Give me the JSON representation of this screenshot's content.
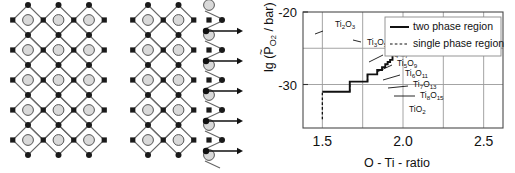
{
  "figure": {
    "left_panel": {
      "name": "crystallographic-shear-lattice-diagram",
      "description": "Two polyhedral lattice schematics: ideal rutile-type lattice (left) and sheared lattice with shear plane (right), with five arrows at right indicating shear direction",
      "arrow_count": 5,
      "atom_legend": {
        "large_circle": "metal-cation-site",
        "small_square": "oxygen-corner-site",
        "small_dot": "oxygen-vertex-site"
      },
      "colors": {
        "circle_fill": "#d9d9d9",
        "circle_stroke": "#555555",
        "node_fill": "#1a1a1a",
        "bond_stroke": "#666666",
        "arrow": "#111111"
      }
    },
    "chart_panel": {
      "legend": {
        "items": [
          {
            "label": "two phase region",
            "style": "solid"
          },
          {
            "label": "single phase region",
            "style": "dashed"
          }
        ]
      },
      "axes": {
        "xlabel": "O - Ti - ratio",
        "ylabel_main": "lg (",
        "ylabel_p": "P",
        "ylabel_tilde": "~",
        "ylabel_sub": "O",
        "ylabel_sub2": "2",
        "ylabel_tail": " / bar)",
        "xticks": [
          "1.5",
          "2.0",
          "2.5"
        ],
        "yticks": [
          "-30",
          "-20"
        ]
      },
      "annotations": [
        {
          "id": "ti2o3",
          "base": "Ti",
          "s1": "2",
          "mid": "O",
          "s2": "3"
        },
        {
          "id": "ti3o5",
          "base": "Ti",
          "s1": "3",
          "mid": "O",
          "s2": "5"
        },
        {
          "id": "ti4o7",
          "base": "Ti",
          "s1": "4",
          "mid": "O",
          "s2": "7"
        },
        {
          "id": "ti5o9",
          "base": "Ti",
          "s1": "5",
          "mid": "O",
          "s2": "9"
        },
        {
          "id": "ti6o11",
          "base": "Ti",
          "s1": "6",
          "mid": "O",
          "s2": "11"
        },
        {
          "id": "ti7o13",
          "base": "Ti",
          "s1": "7",
          "mid": "O",
          "s2": "13"
        },
        {
          "id": "ti8o15",
          "base": "Ti",
          "s1": "8",
          "mid": "O",
          "s2": "15"
        },
        {
          "id": "tio2",
          "base": "Ti",
          "s1": "",
          "mid": "O",
          "s2": "2"
        }
      ]
    }
  },
  "chart_data": {
    "type": "line",
    "title": "",
    "xlabel": "O - Ti - ratio",
    "ylabel": "lg (PO2 / bar)",
    "xlim": [
      1.38,
      2.62
    ],
    "ylim": [
      -36.0,
      -20.0
    ],
    "xticks": [
      1.5,
      2.0,
      2.5
    ],
    "xtick_labels": [
      "1.5",
      "2.0",
      "2.5"
    ],
    "yticks": [
      -30,
      -20
    ],
    "ytick_labels": [
      "-30",
      "-20"
    ],
    "grid": true,
    "gridlines_x": [
      1.5,
      1.75,
      2.0,
      2.25,
      2.5
    ],
    "gridlines_y": [
      -30,
      -25
    ],
    "legend_position": "top-right",
    "series": [
      {
        "name": "two phase region",
        "style": "solid",
        "points": [
          [
            1.5,
            -31.0
          ],
          [
            1.67,
            -31.0
          ],
          [
            1.67,
            -29.6
          ],
          [
            1.78,
            -29.6
          ],
          [
            1.78,
            -28.6
          ],
          [
            1.84,
            -28.6
          ],
          [
            1.84,
            -28.0
          ],
          [
            1.87,
            -28.0
          ],
          [
            1.87,
            -27.6
          ],
          [
            1.89,
            -27.6
          ],
          [
            1.89,
            -27.2
          ],
          [
            1.905,
            -27.2
          ],
          [
            1.905,
            -26.9
          ],
          [
            1.92,
            -26.9
          ],
          [
            1.92,
            -26.6
          ],
          [
            1.935,
            -26.6
          ],
          [
            1.935,
            -25.9
          ],
          [
            2.0,
            -25.9
          ]
        ]
      },
      {
        "name": "single phase region",
        "style": "dashed",
        "segments": [
          {
            "from": [
              1.5,
              -34.8
            ],
            "to": [
              1.5,
              -31.0
            ]
          },
          {
            "from": [
              1.67,
              -31.0
            ],
            "to": [
              1.67,
              -29.6
            ]
          },
          {
            "from": [
              1.78,
              -29.6
            ],
            "to": [
              1.78,
              -28.6
            ]
          }
        ]
      }
    ],
    "phase_labels": [
      {
        "text": "Ti2O3",
        "x": 1.5,
        "y": -34.2
      },
      {
        "text": "Ti3O5",
        "x": 1.67,
        "y": -31.1
      },
      {
        "text": "Ti4O7",
        "x": 1.78,
        "y": -30.2
      },
      {
        "text": "Ti5O9",
        "x": 1.84,
        "y": -29.2
      },
      {
        "text": "Ti6O11",
        "x": 1.87,
        "y": -28.3
      },
      {
        "text": "Ti7O13",
        "x": 1.9,
        "y": -27.4
      },
      {
        "text": "Ti8O15",
        "x": 1.935,
        "y": -26.4
      },
      {
        "text": "TiO2",
        "x": 2.0,
        "y": -24.4
      }
    ]
  }
}
